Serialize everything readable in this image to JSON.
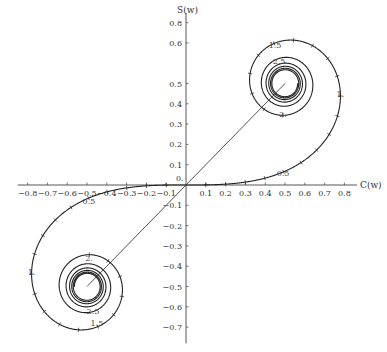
{
  "chart_data": {
    "type": "line",
    "title": "",
    "xlabel": "C(w)",
    "ylabel": "S(w)",
    "xlim": [
      -0.85,
      0.85
    ],
    "ylim": [
      -0.78,
      0.88
    ],
    "grid": false,
    "legend": null,
    "x_ticks": [
      -0.8,
      -0.7,
      -0.6,
      -0.5,
      -0.4,
      -0.3,
      -0.2,
      -0.1,
      0.1,
      0.2,
      0.3,
      0.4,
      0.5,
      0.6,
      0.7,
      0.8
    ],
    "x_tick_labels": [
      "-0.8",
      "-0.7",
      "-0.6",
      "-0.5",
      "-0.4",
      "-0.3",
      "-0.2",
      "-0.1",
      "0.1",
      "0.2",
      "0.3",
      "0.4",
      "0.5",
      "0.6",
      "0.7",
      "0.8"
    ],
    "y_ticks": [
      0.8,
      0.7,
      0.5,
      0.4,
      0.3,
      0.2,
      0.1,
      -0.1,
      -0.2,
      -0.3,
      -0.4,
      -0.5,
      -0.6,
      -0.7
    ],
    "y_tick_labels": [
      "0.8",
      "0.6",
      "0.5",
      "0.4",
      "0.3",
      "0.2",
      "0.1",
      "-0.1",
      "-0.2",
      "-0.3",
      "-0.4",
      "-0.5",
      "-0.6",
      "-0.7"
    ],
    "origin_label": "0.",
    "series": [
      {
        "name": "Cornu spiral",
        "parameter": "w",
        "w_range": [
          -5,
          5
        ],
        "x": "C(w)",
        "y": "S(w)",
        "tick_step": 0.1
      },
      {
        "name": "center line",
        "points": [
          [
            -0.5,
            -0.5
          ],
          [
            0.5,
            0.5
          ]
        ]
      }
    ],
    "annotations": [
      {
        "text": "0.5",
        "w": 0.5,
        "x": 0.49,
        "y": 0.06
      },
      {
        "text": "1.",
        "w": 1.0,
        "x": 0.78,
        "y": 0.45
      },
      {
        "text": "1.5",
        "w": 1.5,
        "x": 0.45,
        "y": 0.69
      },
      {
        "text": "2.",
        "w": 2.0,
        "x": 0.49,
        "y": 0.35
      },
      {
        "text": "2.5",
        "w": 2.5,
        "x": 0.47,
        "y": 0.61
      },
      {
        "text": "0.5",
        "w": -0.5,
        "x": -0.49,
        "y": -0.08
      },
      {
        "text": "1.",
        "w": -1.0,
        "x": -0.78,
        "y": -0.43
      },
      {
        "text": "1.5",
        "w": -1.5,
        "x": -0.45,
        "y": -0.68
      },
      {
        "text": "2.",
        "w": -2.0,
        "x": -0.49,
        "y": -0.36
      },
      {
        "text": "2.5",
        "w": -2.5,
        "x": -0.47,
        "y": -0.62
      }
    ],
    "asymptotic_centers": [
      [
        0.5,
        0.5
      ],
      [
        -0.5,
        -0.5
      ]
    ]
  },
  "layout": {
    "origin_px": [
      186,
      185
    ],
    "x_scale_px": 198,
    "y_scale_px": 203,
    "curve_color": "#222222",
    "line_color": "#555555",
    "axis_color": "#444444"
  }
}
